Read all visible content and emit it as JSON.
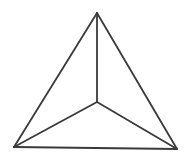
{
  "diagram": {
    "type": "triangle-with-interior-point",
    "background": "#ffffff",
    "stroke_color": "#3a3a3a",
    "stroke_width": 1.8,
    "vertices": {
      "apex": {
        "x": 97,
        "y": 13
      },
      "bottom_left": {
        "x": 14,
        "y": 147
      },
      "bottom_right": {
        "x": 177,
        "y": 149
      },
      "center": {
        "x": 97,
        "y": 102
      }
    },
    "edges": [
      {
        "name": "apex-to-bottom-left",
        "from": "apex",
        "to": "bottom_left"
      },
      {
        "name": "apex-to-bottom-right",
        "from": "apex",
        "to": "bottom_right"
      },
      {
        "name": "bottom-left-to-bottom-right",
        "from": "bottom_left",
        "to": "bottom_right"
      },
      {
        "name": "apex-to-center",
        "from": "apex",
        "to": "center"
      },
      {
        "name": "center-to-bottom-left",
        "from": "center",
        "to": "bottom_left"
      },
      {
        "name": "center-to-bottom-right",
        "from": "center",
        "to": "bottom_right"
      }
    ]
  }
}
